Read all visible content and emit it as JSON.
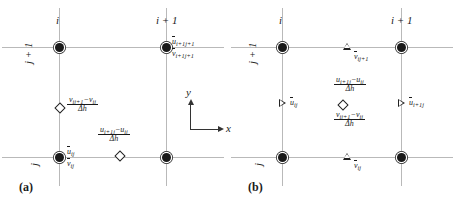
{
  "figure": {
    "type": "finite-difference grid stencil diagram",
    "panels": [
      {
        "id": "a",
        "caption": "(a)",
        "column_labels": [
          "i",
          "i + 1"
        ],
        "row_labels": [
          "j + 1",
          "j"
        ],
        "nodes": [
          {
            "name": "node-top-left",
            "position": "i, j+1",
            "labels": []
          },
          {
            "name": "node-top-right",
            "position": "i+1, j+1",
            "labels": [
              "u",
              "v"
            ],
            "u_label": "u",
            "u_sub": "i+1j+1",
            "v_label": "v",
            "v_sub": "i+1j+1"
          },
          {
            "name": "node-bottom-left",
            "position": "i, j",
            "labels": [
              "u",
              "v"
            ],
            "u_label": "u",
            "u_sub": "ij",
            "v_label": "v",
            "v_sub": "ij"
          },
          {
            "name": "node-bottom-right",
            "position": "i+1, j",
            "labels": []
          }
        ],
        "derivatives": [
          {
            "name": "dv-dy",
            "marker": "diamond",
            "numerator_terms": [
              {
                "var": "v",
                "sub": "ij+1"
              },
              {
                "op": "−"
              },
              {
                "var": "v",
                "sub": "ij"
              }
            ],
            "denominator": "Δh",
            "numerator_text": "v̅ij+1 − v̅ij",
            "denominator_text": "Δh"
          },
          {
            "name": "du-dx",
            "marker": "diamond",
            "numerator_terms": [
              {
                "var": "u",
                "sub": "i+1j"
              },
              {
                "op": "−"
              },
              {
                "var": "u",
                "sub": "ij"
              }
            ],
            "denominator": "Δh",
            "numerator_text": "u̅i+1j − u̅ij",
            "denominator_text": "Δh"
          }
        ]
      },
      {
        "id": "b",
        "caption": "(b)",
        "column_labels": [
          "i",
          "i + 1"
        ],
        "row_labels": [
          "j + 1",
          "j"
        ],
        "nodes": [
          {
            "name": "node-top-left",
            "position": "i, j+1",
            "labels": []
          },
          {
            "name": "node-top-right",
            "position": "i+1, j+1",
            "labels": []
          },
          {
            "name": "node-bottom-left",
            "position": "i, j",
            "labels": []
          },
          {
            "name": "node-bottom-right",
            "position": "i+1, j",
            "labels": []
          }
        ],
        "face_values": [
          {
            "name": "v-top-face",
            "marker": "triangle-up",
            "var": "v",
            "sub": "ij+1"
          },
          {
            "name": "v-bottom-face",
            "marker": "triangle-up",
            "var": "v",
            "sub": "ij"
          },
          {
            "name": "u-left-face",
            "marker": "triangle-right",
            "var": "u",
            "sub": "ij"
          },
          {
            "name": "u-right-face",
            "marker": "triangle-right",
            "var": "u",
            "sub": "i+1j"
          }
        ],
        "derivatives": [
          {
            "name": "du-dx",
            "marker": "diamond",
            "numerator_terms": [
              {
                "var": "u",
                "sub": "i+1j"
              },
              {
                "op": "−"
              },
              {
                "var": "u",
                "sub": "ij"
              }
            ],
            "denominator": "Δh",
            "numerator_text": "u̅i+1j − u̅ij",
            "denominator_text": "Δh"
          },
          {
            "name": "dv-dy",
            "marker": "diamond",
            "numerator_terms": [
              {
                "var": "v",
                "sub": "ij+1"
              },
              {
                "op": "−"
              },
              {
                "var": "v",
                "sub": "ij"
              }
            ],
            "denominator": "Δh",
            "numerator_text": "v̅ij+1 − v̅ij",
            "denominator_text": "Δh"
          }
        ]
      }
    ],
    "axes": {
      "name": "coordinate-axes",
      "x_label": "x",
      "y_label": "y"
    },
    "symbols": {
      "minus": "−",
      "delta_h": "Δh",
      "u": "u",
      "v": "v"
    },
    "colors": {
      "gridline": "#b9b9b9",
      "node": "#1a1a1a",
      "text": "#1a1a1a",
      "background": "#ffffff"
    }
  }
}
